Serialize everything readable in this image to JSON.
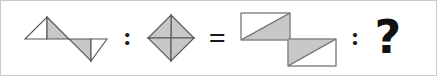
{
  "panel": {
    "background_color": "#ffffff",
    "border_color": "#c9c9c9"
  },
  "style": {
    "shape_fill_gray": "#c8c8c8",
    "shape_fill_white": "#ffffff",
    "shape_stroke": "#555555",
    "symbol_color": "#1a1a1a"
  },
  "puzzle": {
    "type": "visual-analogy",
    "statement": "A : B = C : ?",
    "operators": {
      "colon_1": ":",
      "equals": "=",
      "colon_2": ":",
      "question": "?"
    },
    "terms": [
      {
        "id": "term-a",
        "name": "two-triangles-s-shape",
        "description": "Left: upward triangle with white left half and gray right half; Right: downward triangle with gray left half and white right half"
      },
      {
        "id": "term-b",
        "name": "diamond-quartered",
        "description": "Diamond (rotated square) split by both diagonals into four gray triangles"
      },
      {
        "id": "term-c",
        "name": "two-rectangles-diagonal",
        "description": "Upper rectangle split by diagonal: white upper-left, gray lower-right; Lower-right rectangle split by diagonal: gray upper-left, white lower-right"
      },
      {
        "id": "term-d",
        "name": "unknown-answer",
        "description": "Question mark representing the missing figure"
      }
    ]
  }
}
